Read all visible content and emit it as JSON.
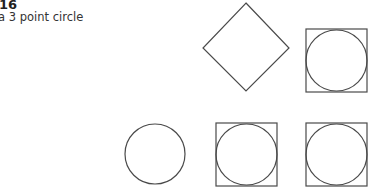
{
  "header": {
    "number": "16",
    "caption": "a 3 point circle"
  },
  "diagram": {
    "stroke_color": "#4a4a4a",
    "shapes": [
      {
        "type": "diamond",
        "label": "rotated-square"
      },
      {
        "type": "circle-in-square",
        "label": "top-right"
      },
      {
        "type": "circle",
        "label": "bottom-left"
      },
      {
        "type": "circle-in-square",
        "label": "bottom-middle"
      },
      {
        "type": "circle-in-square",
        "label": "bottom-right"
      }
    ]
  }
}
